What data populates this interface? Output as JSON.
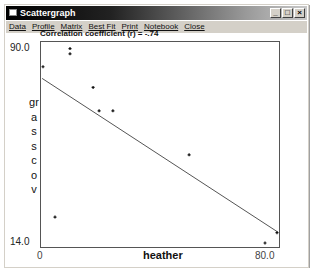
{
  "window": {
    "title": "Scattergraph",
    "controls": [
      "minimize",
      "maximize",
      "close"
    ]
  },
  "menu": {
    "items": [
      "Data",
      "Profile",
      "Matrix",
      "Best Fit",
      "Print",
      "Notebook",
      "Close"
    ]
  },
  "correlation_label": "Correlation coefficient (r) = -.74",
  "chart_data": {
    "type": "scatter",
    "title": "Correlation coefficient (r) = -.74",
    "xlabel": "heather",
    "ylabel": "grasscov",
    "xlim": [
      0,
      80.0
    ],
    "ylim": [
      14.0,
      90.0
    ],
    "x_tick_labels": [
      "0",
      "80.0"
    ],
    "y_tick_labels": [
      "90.0",
      "14.0"
    ],
    "grid": false,
    "legend": null,
    "correlation_r": -0.74,
    "points": [
      {
        "x": 1,
        "y": 82
      },
      {
        "x": 10,
        "y": 89
      },
      {
        "x": 10,
        "y": 87
      },
      {
        "x": 17.7,
        "y": 74
      },
      {
        "x": 19.7,
        "y": 65
      },
      {
        "x": 24.3,
        "y": 65
      },
      {
        "x": 49.7,
        "y": 48
      },
      {
        "x": 5,
        "y": 24
      },
      {
        "x": 75,
        "y": 14
      },
      {
        "x": 79,
        "y": 18
      }
    ],
    "regression_line": {
      "x1": 0.7,
      "y1": 77.5,
      "x2": 79.3,
      "y2": 18.2
    }
  },
  "labels": {
    "y_top": "90.0",
    "y_bottom": "14.0",
    "x_left": "0",
    "x_right": "80.0",
    "x_title": "heather",
    "y_title": "grasscov"
  }
}
